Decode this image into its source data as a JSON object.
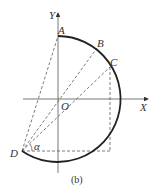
{
  "figure": {
    "caption": "(b)",
    "axes": {
      "x_label": "X",
      "y_label": "Y",
      "origin_label": "O"
    },
    "points": {
      "A": "A",
      "B": "B",
      "C": "C",
      "D": "D"
    },
    "angle_label": "α",
    "colors": {
      "stroke": "#222222",
      "dashed": "#444444",
      "text": "#333333"
    }
  }
}
